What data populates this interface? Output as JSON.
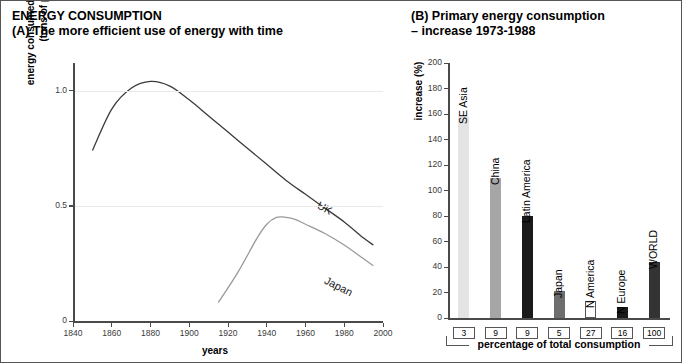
{
  "figure": {
    "heading": "ENERGY CONSUMPTION"
  },
  "panel_a": {
    "label": "(A) The more efficient use of energy with time",
    "ylabel_line1": "energy consumed to yield $1000 GDP",
    "ylabel_line2": "(tons of petroleum)",
    "xlabel": "years",
    "series_labels": {
      "uk": "UK",
      "japan": "Japan"
    }
  },
  "panel_b": {
    "label_line1": "(B) Primary energy consumption",
    "label_line2": "– increase 1973-1988",
    "ylabel": "increase (%)",
    "footer_caption": "percentage of total consumption"
  },
  "chart_data": [
    {
      "type": "line",
      "title": "(A) The more efficient use of energy with time",
      "xlabel": "years",
      "ylabel": "energy consumed to yield $1000 GDP (tons of petroleum)",
      "xlim": [
        1840,
        2000
      ],
      "ylim": [
        0,
        1.12
      ],
      "xticks": [
        1840,
        1860,
        1880,
        1900,
        1920,
        1940,
        1960,
        1980,
        2000
      ],
      "yticks": [
        0,
        0.5,
        1.0
      ],
      "ytick_labels": [
        "0",
        "0.5",
        "1.0"
      ],
      "grid": "horizontal",
      "legend": "inline-curve-labels",
      "series": [
        {
          "name": "UK",
          "x": [
            1850,
            1860,
            1870,
            1880,
            1890,
            1900,
            1910,
            1920,
            1930,
            1940,
            1950,
            1960,
            1970,
            1980,
            1990,
            1995
          ],
          "values": [
            0.74,
            0.92,
            1.01,
            1.04,
            1.02,
            0.96,
            0.89,
            0.82,
            0.75,
            0.68,
            0.61,
            0.55,
            0.49,
            0.43,
            0.36,
            0.33
          ]
        },
        {
          "name": "Japan",
          "x": [
            1915,
            1925,
            1935,
            1940,
            1945,
            1950,
            1955,
            1960,
            1970,
            1980,
            1990,
            1995
          ],
          "values": [
            0.08,
            0.21,
            0.36,
            0.42,
            0.45,
            0.45,
            0.44,
            0.42,
            0.38,
            0.33,
            0.27,
            0.24
          ]
        }
      ]
    },
    {
      "type": "bar",
      "title": "(B) Primary energy consumption – increase 1973-1988",
      "xlabel": "percentage of total consumption",
      "ylabel": "increase (%)",
      "ylim": [
        0,
        200
      ],
      "yticks": [
        0,
        20,
        40,
        60,
        80,
        100,
        120,
        140,
        160,
        180,
        200
      ],
      "categories": [
        "SE Asia",
        "China",
        "Latin America",
        "Japan",
        "N America",
        "N Europe",
        "WORLD"
      ],
      "values": [
        158,
        110,
        80,
        21,
        13,
        9,
        44
      ],
      "share_of_total_consumption": [
        3,
        9,
        9,
        5,
        27,
        16,
        100
      ],
      "bar_colors": [
        "#e4e4e4",
        "#a6a6a6",
        "#1a1a1a",
        "#6e6e6e",
        "#ffffff",
        "#1a1a1a",
        "#333333"
      ]
    }
  ]
}
